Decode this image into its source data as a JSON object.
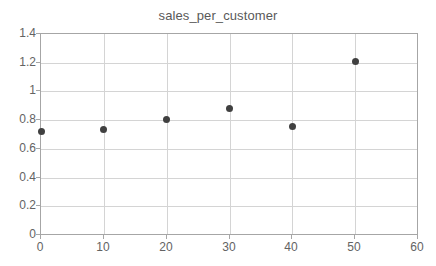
{
  "chart_data": {
    "type": "scatter",
    "title": "sales_per_customer",
    "xlabel": "",
    "ylabel": "",
    "x": [
      0,
      10,
      20,
      30,
      40,
      50
    ],
    "values": [
      0.72,
      0.735,
      0.805,
      0.88,
      0.755,
      1.205
    ],
    "series": [
      {
        "name": "sales_per_customer",
        "x": [
          0,
          10,
          20,
          30,
          40,
          50
        ],
        "values": [
          0.72,
          0.735,
          0.805,
          0.88,
          0.755,
          1.205
        ]
      }
    ],
    "xlim": [
      0,
      60
    ],
    "ylim": [
      0,
      1.4
    ],
    "xticks": [
      0,
      10,
      20,
      30,
      40,
      50,
      60
    ],
    "yticks": [
      0,
      0.2,
      0.4,
      0.6,
      0.8,
      1,
      1.2,
      1.4
    ],
    "xtick_labels": [
      "0",
      "10",
      "20",
      "30",
      "40",
      "50",
      "60"
    ],
    "ytick_labels": [
      "0",
      "0.2",
      "0.4",
      "0.6",
      "0.8",
      "1",
      "1.2",
      "1.4"
    ],
    "grid": true,
    "grid_axes": "both",
    "legend": false,
    "legend_position": "none",
    "marker": "circle",
    "marker_color": "#404040",
    "gridline_color": "#d4d4d4",
    "frame_color": "#a6a6a6",
    "label_color": "#636363",
    "title_color": "#595959",
    "background_color": "#ffffff",
    "annotations": []
  }
}
